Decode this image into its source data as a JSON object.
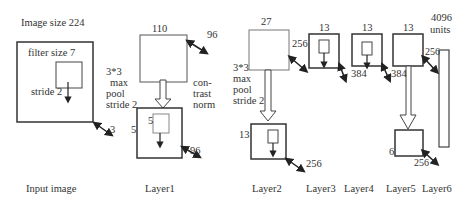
{
  "diagram": {
    "title_input": "Image size 224",
    "input": {
      "filter_label": "filter size 7",
      "stride_label": "stride 2",
      "depth": "3",
      "caption": "Input image"
    },
    "pool1": {
      "line1": "3*3",
      "line2": "max",
      "line3": "pool",
      "line4": "stride 2"
    },
    "layer1": {
      "top_size": "110",
      "top_depth": "96",
      "norm_line1": "con-",
      "norm_line2": "trast",
      "norm_line3": "norm",
      "filter_size": "5",
      "side_size": "5",
      "bottom_depth": "96",
      "caption": "Layer1"
    },
    "layer2": {
      "top_size": "27",
      "top_depth": "256",
      "pool_line1": "3*3",
      "pool_line2": "max",
      "pool_line3": "pool",
      "pool_line4": "stride 2",
      "bottom_size": "13",
      "bottom_depth": "256",
      "caption": "Layer2"
    },
    "layer3": {
      "size": "13",
      "depth": "384",
      "caption": "Layer3"
    },
    "layer4": {
      "size": "13",
      "depth": "384",
      "caption": "Layer4"
    },
    "layer5": {
      "size": "13",
      "bottom_size": "6",
      "bottom_depth": "256",
      "caption": "Layer5"
    },
    "layer6": {
      "units_line1": "4096",
      "units_line2": "units",
      "depth": "256",
      "caption": "Layer6"
    }
  }
}
